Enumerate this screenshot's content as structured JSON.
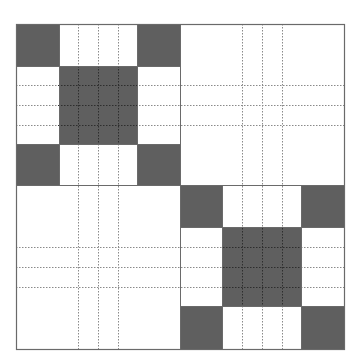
{
  "diagram": {
    "type": "block-matrix-pattern",
    "colors": {
      "background": "#ffffff",
      "dark_fill": "#5f5f5f",
      "border": "#6a6a6a",
      "dash_on_light": "#8a8a8a",
      "dash_on_dark": "#2e2e2e"
    },
    "outer": {
      "x0": 16,
      "y0": 24,
      "x1": 344,
      "y1": 349
    },
    "split": {
      "x": 180,
      "y": 185
    },
    "quadrants": [
      {
        "name": "top-left",
        "x": [
          16,
          59,
          137,
          180
        ],
        "y": [
          24,
          66,
          144,
          185
        ],
        "dark_cells": [
          [
            0,
            0
          ],
          [
            0,
            2
          ],
          [
            1,
            1
          ],
          [
            2,
            0
          ],
          [
            2,
            2
          ]
        ]
      },
      {
        "name": "bottom-right",
        "x": [
          180,
          222,
          301,
          344
        ],
        "y": [
          185,
          227,
          306,
          349
        ],
        "dark_cells": [
          [
            0,
            0
          ],
          [
            0,
            2
          ],
          [
            1,
            1
          ],
          [
            2,
            0
          ],
          [
            2,
            2
          ]
        ]
      }
    ],
    "dashed_vertical_x": [
      78,
      98,
      118,
      242,
      262,
      282
    ],
    "dashed_horizontal_y": [
      85,
      105,
      125,
      247,
      267,
      287
    ],
    "dashed_segments": {
      "vertical_top_left": {
        "x": [
          78,
          98,
          118
        ],
        "y0": 24,
        "y1": 349
      },
      "vertical_right": {
        "x": [
          242,
          262,
          282
        ],
        "y0": 24,
        "y1": 349
      },
      "horizontal_top": {
        "y": [
          85,
          105,
          125
        ],
        "x0": 16,
        "x1": 344
      },
      "horizontal_bottom": {
        "y": [
          247,
          267,
          287
        ],
        "x0": 16,
        "x1": 344
      }
    }
  }
}
